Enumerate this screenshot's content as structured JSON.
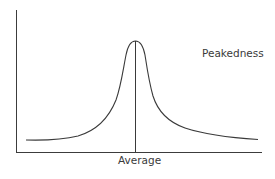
{
  "diagram": {
    "title": "Peakedness",
    "annotation": "Peakedness",
    "x_label": "Average",
    "colors": {
      "line": "#3a3a3a",
      "background": "#ffffff"
    },
    "axes": {
      "y_axis": {
        "x": 16,
        "y_top": 10,
        "y_bottom": 152
      },
      "x_axis": {
        "y": 152,
        "x_left": 16,
        "x_right": 262
      }
    },
    "curve": {
      "shape": "leptokurtic",
      "peak": {
        "x": 135,
        "y": 41
      },
      "left_end": {
        "x": 26,
        "y": 140
      },
      "right_end": {
        "x": 258,
        "y": 140
      }
    },
    "mean_line": {
      "x": 135,
      "y_top": 41,
      "y_bottom": 152
    }
  }
}
